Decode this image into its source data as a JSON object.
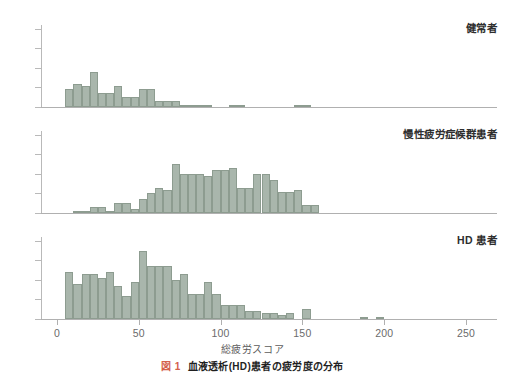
{
  "figure": {
    "xaxis_title": "総疲労スコア",
    "caption_number": "図 1",
    "caption_text": "血液透析(HD)患者の疲労度の分布",
    "bar_color": "#a9b6ac",
    "bar_edge_color": "#8d9c90",
    "fignum_color": "#d4604a"
  },
  "chart_data": {
    "type": "bar",
    "title": "血液透析(HD)患者の疲労度の分布",
    "xlabel": "総疲労スコア",
    "ylabel": "",
    "xlim": [
      -5,
      260
    ],
    "ylim": [
      0,
      42
    ],
    "xticks": [
      0,
      50,
      100,
      150,
      200,
      250
    ],
    "yticks": [
      0,
      10,
      20,
      30,
      40
    ],
    "grid": false,
    "legend": "none",
    "bin_width": 5,
    "panels": [
      {
        "label": "健常者",
        "bin_starts": [
          5,
          10,
          15,
          20,
          25,
          30,
          35,
          40,
          45,
          50,
          55,
          60,
          65,
          70,
          75,
          80,
          85,
          90,
          95,
          100,
          105,
          110,
          115,
          120,
          125,
          130,
          135,
          140,
          145,
          150,
          155,
          160,
          165,
          170,
          175,
          180,
          185,
          190
        ],
        "values": [
          9,
          12,
          11,
          18,
          7,
          7,
          11,
          5,
          5,
          9,
          9,
          3,
          3,
          3,
          1,
          1,
          1,
          1,
          0,
          0,
          1,
          1,
          0,
          0,
          0,
          0,
          0,
          0,
          1,
          1,
          0,
          0,
          0,
          0,
          0,
          0,
          0,
          0
        ]
      },
      {
        "label": "慢性疲労症候群患者",
        "bin_starts": [
          10,
          15,
          20,
          25,
          30,
          35,
          40,
          45,
          50,
          55,
          60,
          65,
          70,
          75,
          80,
          85,
          90,
          95,
          100,
          105,
          110,
          115,
          120,
          125,
          130,
          135,
          140,
          145,
          150,
          155,
          160,
          165,
          170,
          175,
          180,
          185,
          190,
          195,
          200,
          205,
          210
        ],
        "values": [
          1,
          1,
          3,
          3,
          1,
          5,
          5,
          2,
          7,
          10,
          13,
          12,
          25,
          20,
          20,
          20,
          19,
          22,
          22,
          23,
          13,
          13,
          20,
          20,
          17,
          11,
          11,
          12,
          4,
          4,
          0,
          0,
          0,
          0,
          0,
          0,
          0,
          0,
          0,
          0,
          0
        ]
      },
      {
        "label": "HD 患者",
        "bin_starts": [
          5,
          10,
          15,
          20,
          25,
          30,
          35,
          40,
          45,
          50,
          55,
          60,
          65,
          70,
          75,
          80,
          85,
          90,
          95,
          100,
          105,
          110,
          115,
          120,
          125,
          130,
          135,
          140,
          145,
          150,
          155,
          160,
          165,
          170,
          175,
          180,
          185,
          190,
          195,
          200,
          205,
          210,
          215,
          220,
          225,
          230,
          235,
          240
        ],
        "values": [
          24,
          18,
          23,
          23,
          21,
          24,
          17,
          12,
          19,
          35,
          27,
          27,
          27,
          20,
          23,
          13,
          13,
          19,
          13,
          7,
          7,
          7,
          4,
          4,
          3,
          3,
          2,
          3,
          0,
          5,
          0,
          0,
          0,
          0,
          0,
          0,
          1,
          0,
          1,
          0,
          0,
          0,
          0,
          0,
          0,
          0,
          0,
          0
        ]
      }
    ]
  },
  "axis_ticks": {
    "y": [
      "40",
      "30",
      "20",
      "10",
      "0"
    ],
    "x": [
      "0",
      "50",
      "100",
      "150",
      "200",
      "250"
    ]
  }
}
